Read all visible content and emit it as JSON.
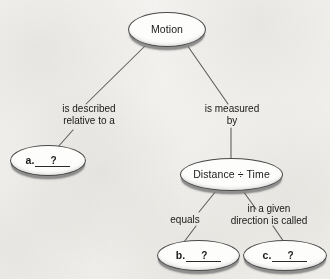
{
  "diagram": {
    "type": "concept-map",
    "background_color": "#f5f4f2",
    "node_fill_color": "#fdfdfc",
    "node_outline_color": "#4a4a4a",
    "node_shadow_color": "#8e8e8e",
    "connector_color": "#5a5a5a",
    "nodes": [
      {
        "id": "motion",
        "label": "Motion",
        "kind": "concept",
        "x": 128,
        "y": 12,
        "w": 78,
        "h": 35
      },
      {
        "id": "answer_a",
        "kind": "blank",
        "letter": "a.",
        "value": "?",
        "x": 10,
        "y": 145,
        "w": 76,
        "h": 31
      },
      {
        "id": "distance_time",
        "label": "Distance ÷ Time",
        "kind": "concept",
        "x": 180,
        "y": 158,
        "w": 103,
        "h": 33
      },
      {
        "id": "answer_b",
        "kind": "blank",
        "letter": "b.",
        "value": "?",
        "x": 157,
        "y": 240,
        "w": 83,
        "h": 31
      },
      {
        "id": "answer_c",
        "kind": "blank",
        "letter": "c.",
        "value": "?",
        "x": 243,
        "y": 240,
        "w": 84,
        "h": 31
      }
    ],
    "edges": [
      {
        "id": "motion-to-a",
        "from": "motion",
        "to": "answer_a",
        "label": "is described\nrelative to a",
        "label_line1": "is described",
        "label_line2": "relative to a"
      },
      {
        "id": "motion-to-distance",
        "from": "motion",
        "to": "distance_time",
        "label": "is measured\nby",
        "label_line1": "is measured",
        "label_line2": "by"
      },
      {
        "id": "distance-to-b",
        "from": "distance_time",
        "to": "answer_b",
        "label": "equals",
        "label_line1": "equals",
        "label_line2": ""
      },
      {
        "id": "distance-to-c",
        "from": "distance_time",
        "to": "answer_c",
        "label": "in a given\ndirection is called",
        "label_line1": "in a given",
        "label_line2": "direction is called"
      }
    ]
  }
}
